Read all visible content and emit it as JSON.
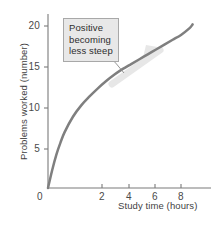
{
  "chart_data": {
    "type": "line",
    "title": "",
    "subtitle": "",
    "xlabel": "Study time (hours)",
    "ylabel": "Problems worked (number)",
    "xlim": [
      0,
      9.2
    ],
    "ylim": [
      0,
      21.5
    ],
    "xticks": [
      0,
      2,
      4,
      6,
      8
    ],
    "xtick_labels": [
      "0",
      "2",
      "4",
      "6",
      "8"
    ],
    "yticks": [
      5,
      10,
      15,
      20
    ],
    "ytick_labels": [
      "5",
      "10",
      "15",
      "20"
    ],
    "grid": false,
    "legend": null,
    "series": [
      {
        "name": "Problems worked vs study time",
        "color": "#7f7f7f",
        "x": [
          0,
          0.25,
          0.5,
          0.75,
          1,
          1.5,
          2,
          2.5,
          3,
          3.5,
          4,
          4.5,
          5,
          5.5,
          6,
          6.5,
          7,
          7.5,
          8,
          8.5,
          8.7
        ],
        "y": [
          0,
          2.2,
          4.1,
          5.6,
          6.9,
          8.8,
          10.2,
          11.3,
          12.3,
          13.2,
          14.0,
          14.7,
          15.3,
          15.9,
          16.5,
          17.1,
          17.7,
          18.3,
          18.9,
          19.7,
          20.2
        ]
      }
    ],
    "annotations": [
      {
        "name": "curve-annotation",
        "lines": [
          "Positive",
          "becoming",
          "less steep"
        ],
        "text": "Positive becoming less steep",
        "box_fill": "#e8e8e8",
        "box_border": "#a8a8a8",
        "points_to_x": 4.1,
        "points_to_y": 14.1
      },
      {
        "name": "trend-arrow-overlay",
        "text": "",
        "color": "#d2d2d2",
        "direction": "up-right along curve"
      }
    ],
    "axis_color": "#7a7a7a",
    "tick_color": "#7a7a7a"
  }
}
